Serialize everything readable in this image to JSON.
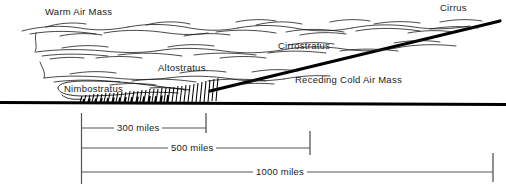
{
  "figure": {
    "type": "warm-front-cross-section-diagram",
    "labels": {
      "warm_air_mass": "Warm Air Mass",
      "cirrus": "Cirrus",
      "cirrostratus": "Cirrostratus",
      "altostratus": "Altostratus",
      "nimbostratus": "Nimbostratus",
      "receding_cold_air_mass": "Receding Cold Air Mass"
    },
    "scale_bars": [
      {
        "label": "300 miles",
        "value": 300,
        "unit": "miles"
      },
      {
        "label": "500 miles",
        "value": 500,
        "unit": "miles"
      },
      {
        "label": "1000 miles",
        "value": 1000,
        "unit": "miles"
      }
    ],
    "colors": {
      "ink": "#000000",
      "line": "#1a1a1a",
      "background": "#ffffff",
      "scale_rule": "#555555"
    }
  }
}
